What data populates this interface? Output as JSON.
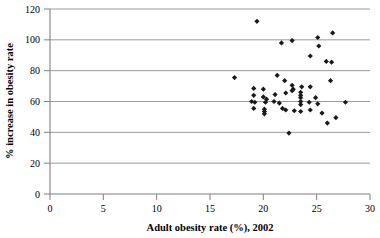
{
  "chart_data": {
    "type": "scatter",
    "title": "",
    "xlabel": "Adult obesity rate (%), 2002",
    "ylabel": "% increase in obesity rate",
    "xlim": [
      0,
      30
    ],
    "ylim": [
      0,
      120
    ],
    "xticks": [
      0,
      5,
      10,
      15,
      20,
      25,
      30
    ],
    "yticks": [
      0,
      20,
      40,
      60,
      80,
      100,
      120
    ],
    "xtick_labels": [
      "0",
      "5",
      "10",
      "15",
      "20",
      "25",
      "30"
    ],
    "ytick_labels": [
      "0",
      "20",
      "40",
      "60",
      "80",
      "100",
      "120"
    ],
    "grid": "horizontal",
    "legend": null,
    "marker": "diamond",
    "marker_color": "#1a1a1a",
    "points": [
      {
        "x": 19.4,
        "y": 112.0
      },
      {
        "x": 21.7,
        "y": 98.0
      },
      {
        "x": 22.7,
        "y": 99.5
      },
      {
        "x": 25.1,
        "y": 101.5
      },
      {
        "x": 26.5,
        "y": 104.5
      },
      {
        "x": 25.2,
        "y": 96.0
      },
      {
        "x": 24.4,
        "y": 89.5
      },
      {
        "x": 25.9,
        "y": 86.0
      },
      {
        "x": 26.4,
        "y": 85.5
      },
      {
        "x": 21.3,
        "y": 77.0
      },
      {
        "x": 22.0,
        "y": 73.5
      },
      {
        "x": 26.3,
        "y": 73.5
      },
      {
        "x": 17.3,
        "y": 75.5
      },
      {
        "x": 19.1,
        "y": 68.5
      },
      {
        "x": 20.0,
        "y": 68.0
      },
      {
        "x": 22.7,
        "y": 70.5
      },
      {
        "x": 22.8,
        "y": 68.0
      },
      {
        "x": 23.6,
        "y": 69.5
      },
      {
        "x": 24.4,
        "y": 69.5
      },
      {
        "x": 22.7,
        "y": 67.0
      },
      {
        "x": 19.1,
        "y": 64.0
      },
      {
        "x": 20.0,
        "y": 63.0
      },
      {
        "x": 21.1,
        "y": 64.5
      },
      {
        "x": 22.1,
        "y": 65.5
      },
      {
        "x": 23.5,
        "y": 66.0
      },
      {
        "x": 23.5,
        "y": 64.0
      },
      {
        "x": 23.5,
        "y": 62.5
      },
      {
        "x": 24.9,
        "y": 62.5
      },
      {
        "x": 18.9,
        "y": 60.0
      },
      {
        "x": 19.2,
        "y": 59.5
      },
      {
        "x": 20.2,
        "y": 59.5
      },
      {
        "x": 20.3,
        "y": 61.5
      },
      {
        "x": 21.0,
        "y": 60.0
      },
      {
        "x": 21.5,
        "y": 59.0
      },
      {
        "x": 23.5,
        "y": 60.0
      },
      {
        "x": 23.5,
        "y": 58.0
      },
      {
        "x": 24.3,
        "y": 59.5
      },
      {
        "x": 25.1,
        "y": 58.5
      },
      {
        "x": 27.7,
        "y": 59.5
      },
      {
        "x": 19.1,
        "y": 55.5
      },
      {
        "x": 20.1,
        "y": 55.0
      },
      {
        "x": 20.1,
        "y": 53.5
      },
      {
        "x": 20.1,
        "y": 52.0
      },
      {
        "x": 21.8,
        "y": 55.5
      },
      {
        "x": 22.1,
        "y": 54.5
      },
      {
        "x": 22.9,
        "y": 54.0
      },
      {
        "x": 23.5,
        "y": 53.5
      },
      {
        "x": 24.4,
        "y": 54.5
      },
      {
        "x": 25.5,
        "y": 52.5
      },
      {
        "x": 26.8,
        "y": 49.5
      },
      {
        "x": 26.0,
        "y": 46.0
      },
      {
        "x": 22.4,
        "y": 39.5
      }
    ]
  },
  "axes": {
    "x_title": "Adult obesity rate (%), 2002",
    "y_title": "% increase in obesity rate"
  }
}
